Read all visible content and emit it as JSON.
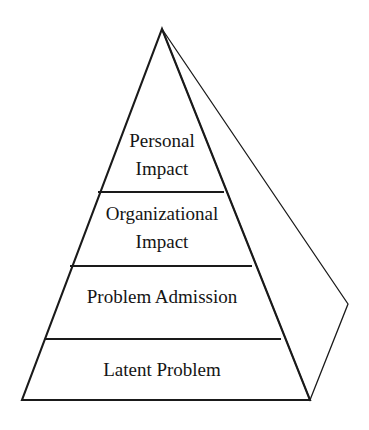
{
  "diagram": {
    "type": "pyramid",
    "title": "",
    "orientation": "apex-top",
    "style": "3d-outline",
    "background_color": "#ffffff",
    "line_color": "#1a1a1a",
    "text_color": "#151515",
    "fill_color": "none",
    "tier_count": 4,
    "tiers": [
      {
        "index": 1,
        "position": "top",
        "label": "Personal Impact",
        "line1": "Personal",
        "line2": "Impact"
      },
      {
        "index": 2,
        "position": "upper-middle",
        "label": "Organizational Impact",
        "line1": "Organizational",
        "line2": "Impact"
      },
      {
        "index": 3,
        "position": "lower-middle",
        "label": "Problem Admission",
        "line1": "Problem Admission",
        "line2": ""
      },
      {
        "index": 4,
        "position": "bottom",
        "label": "Latent Problem",
        "line1": "Latent Problem",
        "line2": ""
      }
    ]
  },
  "geometry": {
    "apex": {
      "x": 162,
      "y": 29
    },
    "base_left": {
      "x": 22,
      "y": 400
    },
    "base_right": {
      "x": 310,
      "y": 400
    },
    "side_vertex": {
      "x": 348,
      "y": 304
    },
    "dividers": [
      {
        "y": 192,
        "x_left": 98,
        "x_right": 224
      },
      {
        "y": 266,
        "x_left": 70,
        "x_right": 252
      },
      {
        "y": 339,
        "x_left": 45,
        "x_right": 281
      }
    ],
    "label_positions": [
      {
        "x": 162,
        "y1": 143,
        "y2": 171
      },
      {
        "x": 162,
        "y1": 216,
        "y2": 244
      },
      {
        "x": 162,
        "y1": 298,
        "y2": 0
      },
      {
        "x": 162,
        "y1": 372,
        "y2": 0
      }
    ],
    "font_sizes": {
      "tier1": 19,
      "tier2": 19,
      "tier3": 19,
      "tier4": 19
    }
  }
}
